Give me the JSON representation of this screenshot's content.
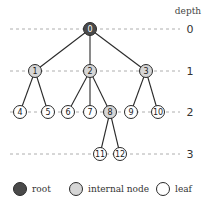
{
  "diagram": {
    "depth_title": "depth",
    "levels": [
      {
        "depth": "0",
        "y": 29
      },
      {
        "depth": "1",
        "y": 71
      },
      {
        "depth": "2",
        "y": 112
      },
      {
        "depth": "3",
        "y": 154
      }
    ],
    "nodes": [
      {
        "id": "0",
        "type": "root",
        "x": 90,
        "y": 29
      },
      {
        "id": "1",
        "type": "internal",
        "x": 35,
        "y": 71
      },
      {
        "id": "2",
        "type": "internal",
        "x": 90,
        "y": 71
      },
      {
        "id": "3",
        "type": "internal",
        "x": 146,
        "y": 71
      },
      {
        "id": "4",
        "type": "leaf",
        "x": 20,
        "y": 112
      },
      {
        "id": "5",
        "type": "leaf",
        "x": 48,
        "y": 112
      },
      {
        "id": "6",
        "type": "leaf",
        "x": 68,
        "y": 112
      },
      {
        "id": "7",
        "type": "leaf",
        "x": 90,
        "y": 112
      },
      {
        "id": "8",
        "type": "internal",
        "x": 110,
        "y": 112
      },
      {
        "id": "9",
        "type": "leaf",
        "x": 131,
        "y": 112
      },
      {
        "id": "10",
        "type": "leaf",
        "x": 158,
        "y": 112
      },
      {
        "id": "11",
        "type": "leaf",
        "x": 100,
        "y": 154
      },
      {
        "id": "12",
        "type": "leaf",
        "x": 120,
        "y": 154
      }
    ],
    "edges": [
      [
        "0",
        "1"
      ],
      [
        "0",
        "2"
      ],
      [
        "0",
        "3"
      ],
      [
        "1",
        "4"
      ],
      [
        "1",
        "5"
      ],
      [
        "2",
        "6"
      ],
      [
        "2",
        "7"
      ],
      [
        "2",
        "8"
      ],
      [
        "3",
        "9"
      ],
      [
        "3",
        "10"
      ],
      [
        "8",
        "11"
      ],
      [
        "8",
        "12"
      ]
    ],
    "colors": {
      "root": "#4a4a4a",
      "internal": "#d6d6d6",
      "leaf": "#ffffff",
      "stroke": "#2a2a2a"
    }
  },
  "legend": {
    "items": [
      {
        "label": "root",
        "type": "root"
      },
      {
        "label": "internal node",
        "type": "internal"
      },
      {
        "label": "leaf",
        "type": "leaf"
      }
    ]
  }
}
